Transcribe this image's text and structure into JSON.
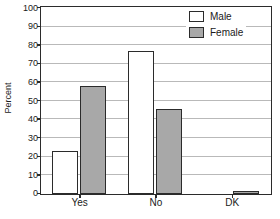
{
  "chart_data": {
    "type": "bar",
    "title": "",
    "subtitle": "",
    "xlabel": "",
    "ylabel": "Percent",
    "categories": [
      "Yes",
      "No",
      "DK"
    ],
    "series": [
      {
        "name": "Male",
        "values": [
          23,
          77,
          0
        ],
        "color": "#ffffff"
      },
      {
        "name": "Female",
        "values": [
          58,
          46,
          1.5
        ],
        "color": "#a8a8a8"
      }
    ],
    "ylim": [
      0,
      100
    ],
    "ytick_step": 10,
    "yticks": [
      0,
      10,
      20,
      30,
      40,
      50,
      60,
      70,
      80,
      90,
      100
    ],
    "ytick_labels": [
      "0",
      "10",
      "20",
      "30",
      "40",
      "50",
      "60",
      "70",
      "80",
      "90",
      "100"
    ],
    "grid": true,
    "grid_axis": "y",
    "grid_color": "#b9b9b9",
    "legend_position": "top-right",
    "frame_color": "#2b2b2b",
    "bar_border_color": "#2b2b2b",
    "background": "#ffffff"
  },
  "legend": {
    "entries": [
      {
        "label": "Male",
        "swatch": "male-swatch"
      },
      {
        "label": "Female",
        "swatch": "female-swatch"
      }
    ]
  }
}
